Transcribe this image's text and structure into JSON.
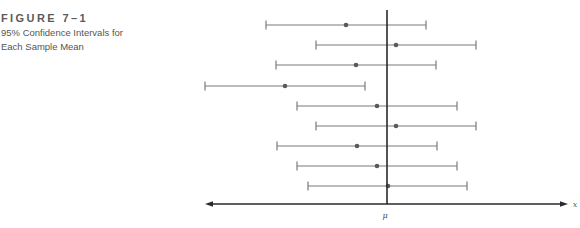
{
  "figure": {
    "title": "FIGURE 7–1",
    "subtitle_line1": "95% Confidence Intervals for",
    "subtitle_line2": "Each Sample Mean"
  },
  "colors": {
    "interval": "#7a7a7a",
    "mean_dot": "#5a5a5a",
    "axis": "#2a2a2a",
    "mu_line": "#2a2a2a",
    "title": "#5a5a5a"
  },
  "chart_data": {
    "type": "interval",
    "title": "95% Confidence Intervals for Each Sample Mean",
    "figure_label": "FIGURE 7–1",
    "xlabel": "x",
    "ylabel": "",
    "reference_line": {
      "label": "μ",
      "x_px": 387
    },
    "axis": {
      "y_px": 204,
      "x_start_px": 205,
      "x_end_px": 568,
      "arrows": "both"
    },
    "intervals": [
      {
        "index": 1,
        "y_px": 25,
        "lower_px": 266,
        "mean_px": 346,
        "upper_px": 426,
        "contains_mu": true
      },
      {
        "index": 2,
        "y_px": 45,
        "lower_px": 316,
        "mean_px": 396,
        "upper_px": 476,
        "contains_mu": true
      },
      {
        "index": 3,
        "y_px": 65,
        "lower_px": 276,
        "mean_px": 356,
        "upper_px": 436,
        "contains_mu": true
      },
      {
        "index": 4,
        "y_px": 86,
        "lower_px": 205,
        "mean_px": 285,
        "upper_px": 365,
        "contains_mu": false
      },
      {
        "index": 5,
        "y_px": 106,
        "lower_px": 297,
        "mean_px": 377,
        "upper_px": 457,
        "contains_mu": true
      },
      {
        "index": 6,
        "y_px": 126,
        "lower_px": 316,
        "mean_px": 396,
        "upper_px": 476,
        "contains_mu": true
      },
      {
        "index": 7,
        "y_px": 146,
        "lower_px": 277,
        "mean_px": 357,
        "upper_px": 437,
        "contains_mu": true
      },
      {
        "index": 8,
        "y_px": 166,
        "lower_px": 297,
        "mean_px": 377,
        "upper_px": 457,
        "contains_mu": true
      },
      {
        "index": 9,
        "y_px": 186,
        "lower_px": 308,
        "mean_px": 388,
        "upper_px": 467,
        "contains_mu": true
      }
    ],
    "grid": false,
    "legend": null
  },
  "labels": {
    "mu": "μ",
    "x": "x"
  }
}
